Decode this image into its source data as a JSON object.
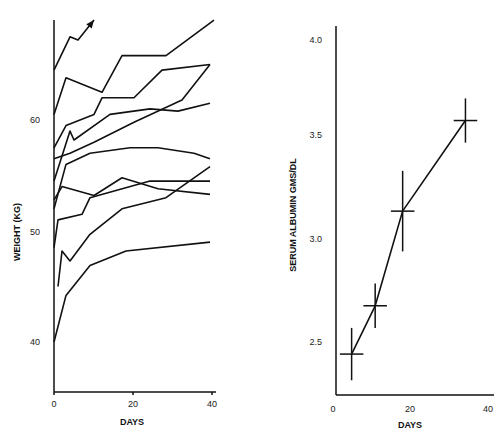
{
  "chart_data": [
    {
      "type": "line",
      "title": "",
      "xlabel": "DAYS",
      "ylabel": "WEIGHT (KG)",
      "xlim": [
        0,
        40
      ],
      "ylim": [
        35,
        68
      ],
      "x_ticks": [
        "0",
        "20",
        "40"
      ],
      "y_ticks": [
        "40",
        "50",
        "60"
      ],
      "grid": false,
      "legend": null,
      "annotations": [
        "arrow at end of top series"
      ],
      "series": [
        {
          "name": "patient-1",
          "x": [
            0,
            4,
            6,
            10
          ],
          "y": [
            64.5,
            67.5,
            67.2,
            69
          ],
          "arrow": true
        },
        {
          "name": "patient-2",
          "x": [
            0,
            3,
            12,
            17,
            28,
            40
          ],
          "y": [
            60.5,
            63.8,
            62.5,
            65.8,
            65.8,
            69
          ]
        },
        {
          "name": "patient-3",
          "x": [
            0,
            3,
            10,
            12,
            20,
            27,
            39
          ],
          "y": [
            57.5,
            59.5,
            60.5,
            62,
            62,
            64.5,
            65
          ]
        },
        {
          "name": "patient-4",
          "x": [
            0,
            4,
            5,
            14,
            24,
            31,
            39
          ],
          "y": [
            54.5,
            59,
            58.2,
            60.5,
            61,
            60.8,
            61.5
          ]
        },
        {
          "name": "patient-5",
          "x": [
            0,
            4,
            10,
            20,
            32,
            39
          ],
          "y": [
            56.5,
            57,
            58,
            59.8,
            61.8,
            65
          ]
        },
        {
          "name": "patient-6",
          "x": [
            0,
            3,
            9,
            19,
            26,
            35,
            39
          ],
          "y": [
            52,
            56,
            57,
            57.5,
            57.5,
            57,
            56.5
          ]
        },
        {
          "name": "patient-7",
          "x": [
            0,
            2,
            10,
            17,
            26,
            39
          ],
          "y": [
            52.8,
            54,
            53.2,
            54.8,
            53.8,
            53.3
          ]
        },
        {
          "name": "patient-8",
          "x": [
            0,
            1,
            7,
            9,
            24,
            39
          ],
          "y": [
            48.5,
            51,
            51.5,
            53,
            54.5,
            54.5
          ]
        },
        {
          "name": "patient-9",
          "x": [
            1,
            2,
            4,
            9,
            17,
            28,
            39
          ],
          "y": [
            45,
            48.2,
            47.3,
            49.7,
            52,
            53,
            55.8
          ]
        },
        {
          "name": "patient-10",
          "x": [
            0,
            3,
            9,
            18,
            39
          ],
          "y": [
            40,
            44.2,
            46.9,
            48.2,
            49
          ]
        }
      ]
    },
    {
      "type": "line",
      "title": "",
      "xlabel": "DAYS",
      "ylabel": "SERUM ALBUMIN GMS/DL",
      "xlim": [
        0,
        40
      ],
      "ylim": [
        2.25,
        4.0
      ],
      "x_ticks": [
        "0",
        "20",
        "40"
      ],
      "y_ticks": [
        "2.5",
        "3.0",
        "3.5",
        "4.0"
      ],
      "grid": false,
      "legend": null,
      "error_bars": true,
      "series": [
        {
          "name": "mean serum albumin",
          "x": [
            5,
            11,
            18,
            34
          ],
          "y": [
            2.44,
            2.68,
            3.15,
            3.6
          ],
          "y_err": [
            0.13,
            0.11,
            0.2,
            0.11
          ],
          "x_err": [
            3,
            3,
            3,
            3
          ]
        }
      ]
    }
  ],
  "left": {
    "ylabel": "WEIGHT (KG)",
    "xlabel": "DAYS",
    "y_ticks": [
      {
        "v": "60",
        "y": 120
      },
      {
        "v": "50",
        "y": 232
      },
      {
        "v": "40",
        "y": 342
      }
    ],
    "x_ticks": [
      {
        "v": "0",
        "x": 54
      },
      {
        "v": "20",
        "x": 133
      },
      {
        "v": "40",
        "x": 212
      }
    ]
  },
  "right": {
    "ylabel": "SERUM ALBUMIN GMS/DL",
    "xlabel": "DAYS",
    "y_ticks": [
      {
        "v": "4.0",
        "y": 40
      },
      {
        "v": "3.5",
        "y": 135
      },
      {
        "v": "3.0",
        "y": 239
      },
      {
        "v": "2.5",
        "y": 342
      }
    ],
    "x_ticks": [
      {
        "v": "0",
        "x": 333
      },
      {
        "v": "20",
        "x": 410
      },
      {
        "v": "40",
        "x": 488
      }
    ]
  }
}
